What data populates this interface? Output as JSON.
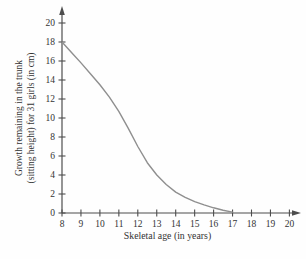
{
  "chart_data": {
    "type": "line",
    "title": "",
    "xlabel": "Skeletal age (in years)",
    "ylabel": "Growth remaining in the trunk (sitting height) for 31 girls (in cm)",
    "ylabel_lines": [
      "Growth remaining in the trunk",
      "(sitting height) for 31 girls (in cm)"
    ],
    "xlim": [
      8,
      20
    ],
    "ylim": [
      0,
      20
    ],
    "x_ticks": [
      8,
      9,
      10,
      11,
      12,
      13,
      14,
      15,
      16,
      17,
      18,
      19,
      20
    ],
    "y_ticks": [
      0,
      2,
      4,
      6,
      8,
      10,
      12,
      14,
      16,
      18,
      20
    ],
    "grid": false,
    "legend": "none",
    "axes_arrows": true,
    "colors": {
      "curve": "#8f8f8f",
      "axis": "#4d4d4d",
      "text": "#333333",
      "background": "#fefefe"
    },
    "series": [
      {
        "name": "growth-remaining-curve",
        "x": [
          8,
          8.5,
          9,
          9.5,
          10,
          10.5,
          11,
          11.5,
          12,
          12.5,
          13,
          13.5,
          14,
          14.5,
          15,
          15.5,
          16,
          16.5,
          17
        ],
        "y": [
          18,
          16.9,
          15.8,
          14.65,
          13.5,
          12.2,
          10.7,
          8.9,
          7.0,
          5.3,
          4.0,
          3.0,
          2.2,
          1.65,
          1.2,
          0.85,
          0.55,
          0.3,
          0.1
        ]
      }
    ]
  }
}
